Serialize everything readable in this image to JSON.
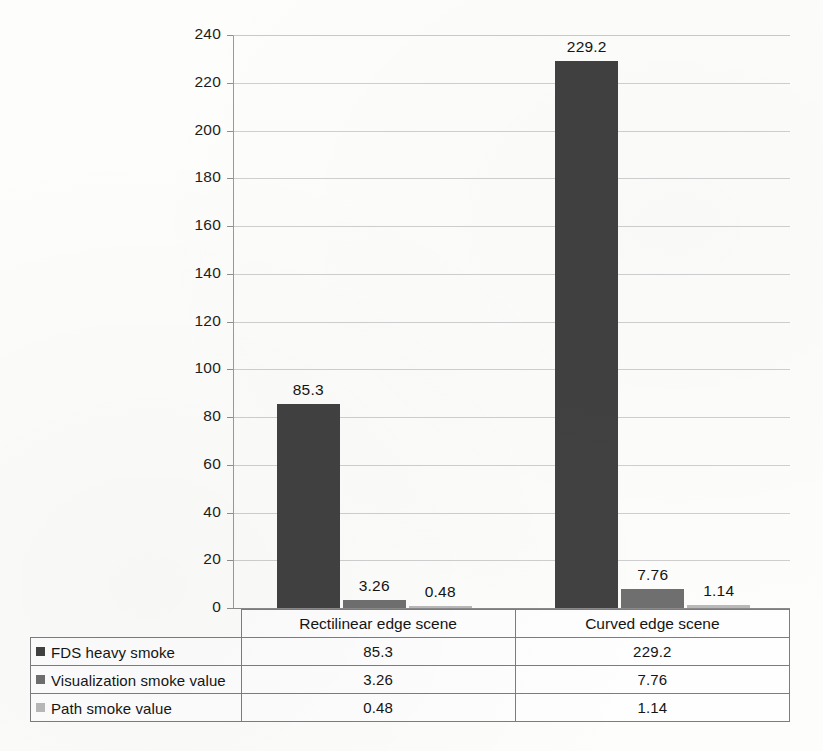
{
  "chart_data": {
    "type": "bar",
    "title": "",
    "xlabel": "",
    "ylabel": "",
    "categories": [
      "Rectilinear edge scene",
      "Curved edge scene"
    ],
    "series": [
      {
        "name": "FDS heavy smoke",
        "values": [
          85.3,
          229.2
        ],
        "color": "#414141"
      },
      {
        "name": "Visualization smoke value",
        "values": [
          3.26,
          7.76
        ],
        "color": "#6f6f6f"
      },
      {
        "name": "Path smoke value",
        "values": [
          0.48,
          1.14
        ],
        "color": "#b9b9b9"
      }
    ],
    "data_labels": [
      [
        "85.3",
        "229.2"
      ],
      [
        "3.26",
        "7.76"
      ],
      [
        "0.48",
        "1.14"
      ]
    ],
    "ylim": [
      0,
      240
    ],
    "yticks": [
      0,
      20,
      40,
      60,
      80,
      100,
      120,
      140,
      160,
      180,
      200,
      220,
      240
    ],
    "ytick_labels": [
      "0",
      "20",
      "40",
      "60",
      "80",
      "100",
      "120",
      "140",
      "160",
      "180",
      "200",
      "220",
      "240"
    ],
    "grid": true,
    "legend_position": "table-first-column"
  },
  "table": {
    "header_blank": "",
    "columns": [
      "Rectilinear edge scene",
      "Curved edge scene"
    ],
    "rows": [
      {
        "label": "FDS heavy smoke",
        "swatch": "series-0-swatch-icon",
        "values": [
          "85.3",
          "229.2"
        ]
      },
      {
        "label": "Visualization smoke value",
        "swatch": "series-1-swatch-icon",
        "values": [
          "3.26",
          "7.76"
        ]
      },
      {
        "label": "Path smoke value",
        "swatch": "series-2-swatch-icon",
        "values": [
          "0.48",
          "1.14"
        ]
      }
    ]
  }
}
